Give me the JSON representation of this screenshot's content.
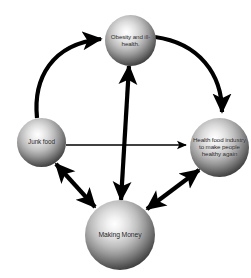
{
  "diagram": {
    "type": "causal-loop-diagram",
    "background_color": "#ffffff",
    "stroke_color": "#000000",
    "nodes": [
      {
        "id": "obesity",
        "label": "Obesity and ill-health.",
        "label_lines": [
          "Obesity and",
          "ill-health."
        ],
        "shape": "sphere",
        "position": "top"
      },
      {
        "id": "junkfood",
        "label": "Junk food",
        "label_lines": [
          "Junk food"
        ],
        "shape": "sphere",
        "position": "left"
      },
      {
        "id": "healthfood",
        "label": "Health food industry to make people healthy again",
        "label_lines": [
          "Health food",
          "industry to",
          "make people",
          "healthy again"
        ],
        "shape": "sphere",
        "position": "right"
      },
      {
        "id": "makingmoney",
        "label": "Making Money",
        "label_lines": [
          "Making Money"
        ],
        "shape": "sphere",
        "position": "bottom"
      }
    ],
    "edges": [
      {
        "id": "junkfood-to-obesity",
        "from": "junkfood",
        "to": "obesity",
        "style": "curved",
        "weight": "thick",
        "arrowheads": "single"
      },
      {
        "id": "obesity-to-healthfood",
        "from": "obesity",
        "to": "healthfood",
        "style": "curved",
        "weight": "thick",
        "arrowheads": "single"
      },
      {
        "id": "junkfood-to-healthfood",
        "from": "junkfood",
        "to": "healthfood",
        "style": "straight",
        "weight": "thin",
        "arrowheads": "single"
      },
      {
        "id": "obesity-makingmoney",
        "from": "obesity",
        "to": "makingmoney",
        "style": "straight",
        "weight": "thick",
        "arrowheads": "double"
      },
      {
        "id": "junkfood-makingmoney",
        "from": "junkfood",
        "to": "makingmoney",
        "style": "straight",
        "weight": "thick",
        "arrowheads": "double"
      },
      {
        "id": "makingmoney-healthfood",
        "from": "makingmoney",
        "to": "healthfood",
        "style": "straight",
        "weight": "thick",
        "arrowheads": "double"
      }
    ]
  }
}
